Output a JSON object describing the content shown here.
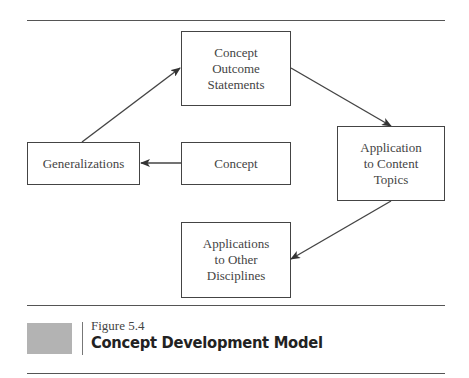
{
  "diagram": {
    "nodes": [
      {
        "id": "concept-outcome-statements",
        "label": "Concept\nOutcome\nStatements"
      },
      {
        "id": "generalizations",
        "label": "Generalizations"
      },
      {
        "id": "concept",
        "label": "Concept"
      },
      {
        "id": "application-content-topics",
        "label": "Application\nto Content\nTopics"
      },
      {
        "id": "applications-other-disciplines",
        "label": "Applications\nto Other\nDisciplines"
      }
    ],
    "edges": [
      {
        "from": "concept",
        "to": "generalizations"
      },
      {
        "from": "generalizations",
        "to": "concept-outcome-statements"
      },
      {
        "from": "concept-outcome-statements",
        "to": "application-content-topics"
      },
      {
        "from": "application-content-topics",
        "to": "applications-other-disciplines"
      }
    ]
  },
  "caption": {
    "figure_number": "Figure 5.4",
    "title": "Concept Development Model"
  },
  "colors": {
    "line": "#444444",
    "swatch": "#b3b3b3"
  }
}
